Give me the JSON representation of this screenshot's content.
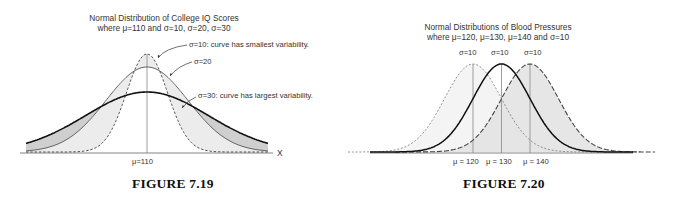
{
  "figures": [
    {
      "caption": "FIGURE 7.19",
      "title_line1": "Normal Distribution of College IQ Scores",
      "title_line2": "where μ=110 and σ=10, σ=20, σ=30",
      "annotations": [
        "σ=10: curve has smallest variability.",
        "σ=20",
        "σ=30: curve has largest variability."
      ],
      "mean_label": "μ=110",
      "axis_label": "X"
    },
    {
      "caption": "FIGURE 7.20",
      "title_line1": "Normal Distributions of Blood Pressures",
      "title_line2": "where μ=120, μ=130, μ=140 and σ=10",
      "sigma_labels": [
        "σ=10",
        "σ=10",
        "σ=10"
      ],
      "mean_labels": [
        "μ = 120",
        "μ = 130",
        "μ = 140"
      ]
    }
  ],
  "chart_data": [
    {
      "type": "line",
      "title": "Normal Distribution of College IQ Scores where μ=110 and σ=10, σ=20, σ=30",
      "xlabel": "X",
      "ylabel": "",
      "x_ticks": [
        "μ=110"
      ],
      "grid": false,
      "series": [
        {
          "name": "σ=10",
          "mean": 110,
          "sd": 10,
          "style": "dashed",
          "note": "curve has smallest variability"
        },
        {
          "name": "σ=20",
          "mean": 110,
          "sd": 20,
          "style": "solid-thin"
        },
        {
          "name": "σ=30",
          "mean": 110,
          "sd": 30,
          "style": "solid-thick",
          "note": "curve has largest variability"
        }
      ]
    },
    {
      "type": "line",
      "title": "Normal Distributions of Blood Pressures where μ=120, μ=130, μ=140 and σ=10",
      "xlabel": "",
      "ylabel": "",
      "x_ticks": [
        "μ = 120",
        "μ = 130",
        "μ = 140"
      ],
      "grid": false,
      "series": [
        {
          "name": "μ=120",
          "mean": 120,
          "sd": 10,
          "style": "short-dashed"
        },
        {
          "name": "μ=130",
          "mean": 130,
          "sd": 10,
          "style": "solid-thick"
        },
        {
          "name": "μ=140",
          "mean": 140,
          "sd": 10,
          "style": "long-dashed"
        }
      ]
    }
  ]
}
